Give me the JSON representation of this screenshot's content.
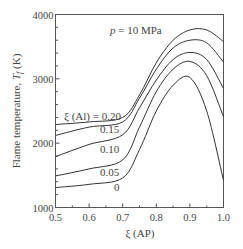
{
  "chart_data": {
    "type": "line",
    "title": "",
    "annotation": "p = 10 MPa",
    "xlabel": "ξ (AP)",
    "ylabel": "Flame temperature, Tf (K)",
    "xlim": [
      0.5,
      1.0
    ],
    "ylim": [
      1000,
      4000
    ],
    "xticks": [
      "0.5",
      "0.6",
      "0.7",
      "0.8",
      "0.9",
      "1.0"
    ],
    "yticks": [
      "1000",
      "2000",
      "3000",
      "4000"
    ],
    "grid": false,
    "legend_position": "inline labels",
    "series_label_prefix": "ξ (Al) = ",
    "x": [
      0.5,
      0.6,
      0.7,
      0.75,
      0.8,
      0.85,
      0.9,
      0.95,
      1.0
    ],
    "series": [
      {
        "name": "0.20",
        "label": "ξ (Al) = 0.20",
        "values": [
          2290,
          2330,
          2400,
          2750,
          3250,
          3600,
          3760,
          3760,
          3580
        ]
      },
      {
        "name": "0.15",
        "label": "0.15",
        "values": [
          2120,
          2250,
          2330,
          2700,
          3150,
          3480,
          3600,
          3560,
          3260
        ]
      },
      {
        "name": "0.10",
        "label": "0.10",
        "values": [
          1790,
          1980,
          2130,
          2550,
          2980,
          3300,
          3410,
          3300,
          2850
        ]
      },
      {
        "name": "0.05",
        "label": "0.05",
        "values": [
          1490,
          1600,
          1740,
          2250,
          2800,
          3150,
          3270,
          3050,
          2410
        ]
      },
      {
        "name": "0",
        "label": "0",
        "values": [
          1310,
          1360,
          1460,
          1900,
          2500,
          2900,
          3020,
          2500,
          1420
        ]
      }
    ]
  },
  "labels": {
    "annotation_p": "p",
    "annotation_rest": " = 10 MPa",
    "ylabel_main": "Flame temperature, ",
    "ylabel_var": "T",
    "ylabel_sub": "f",
    "ylabel_unit": " (K)",
    "xlabel": "ξ (AP)",
    "s020": "ξ (Al) = 0.20",
    "s015": "0.15",
    "s010": "0.10",
    "s005": "0.05",
    "s0": "0"
  }
}
